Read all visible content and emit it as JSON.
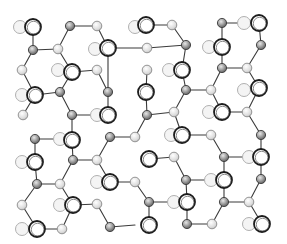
{
  "figure": {
    "title": "",
    "width": 287,
    "height": 244,
    "colors": {
      "bond": "#3a3a3a",
      "big_atom_outline": "#1c1c1c",
      "small_atom_fill": "#9a9a9a",
      "light_atom_fill": "#dcdcdc",
      "faint_atom_outline": "#b0b0b0",
      "background": "#ffffff"
    },
    "atoms": {
      "big": [
        [
          33,
          27
        ],
        [
          72,
          72
        ],
        [
          108,
          48
        ],
        [
          35,
          95
        ],
        [
          108,
          115
        ],
        [
          146,
          25
        ],
        [
          182,
          70
        ],
        [
          222,
          47
        ],
        [
          259,
          23
        ],
        [
          259,
          88
        ],
        [
          222,
          112
        ],
        [
          146,
          92
        ],
        [
          72,
          140
        ],
        [
          35,
          162
        ],
        [
          73,
          205
        ],
        [
          110,
          182
        ],
        [
          37,
          229
        ],
        [
          182,
          135
        ],
        [
          149,
          159
        ],
        [
          224,
          180
        ],
        [
          261,
          157
        ],
        [
          187,
          202
        ],
        [
          149,
          225
        ],
        [
          262,
          224
        ]
      ],
      "small": [
        [
          33,
          50
        ],
        [
          70,
          26
        ],
        [
          60,
          92
        ],
        [
          108,
          92
        ],
        [
          72,
          115
        ],
        [
          186,
          45
        ],
        [
          222,
          23
        ],
        [
          222,
          68
        ],
        [
          186,
          90
        ],
        [
          261,
          45
        ],
        [
          147,
          115
        ],
        [
          35,
          139
        ],
        [
          73,
          160
        ],
        [
          37,
          184
        ],
        [
          110,
          137
        ],
        [
          110,
          227
        ],
        [
          224,
          157
        ],
        [
          186,
          180
        ],
        [
          261,
          179
        ],
        [
          224,
          202
        ],
        [
          187,
          224
        ],
        [
          261,
          135
        ],
        [
          149,
          202
        ]
      ],
      "light": [
        [
          97,
          26
        ],
        [
          58,
          49
        ],
        [
          97,
          70
        ],
        [
          22,
          70
        ],
        [
          23,
          115
        ],
        [
          172,
          25
        ],
        [
          247,
          68
        ],
        [
          211,
          90
        ],
        [
          174,
          112
        ],
        [
          247,
          112
        ],
        [
          147,
          70
        ],
        [
          147,
          48
        ],
        [
          97,
          160
        ],
        [
          60,
          184
        ],
        [
          22,
          205
        ],
        [
          97,
          204
        ],
        [
          62,
          229
        ],
        [
          135,
          137
        ],
        [
          135,
          182
        ],
        [
          211,
          135
        ],
        [
          174,
          157
        ],
        [
          249,
          202
        ],
        [
          212,
          224
        ]
      ],
      "faint": [
        [
          20,
          27
        ],
        [
          58,
          70
        ],
        [
          95,
          49
        ],
        [
          22,
          95
        ],
        [
          97,
          115
        ],
        [
          135,
          27
        ],
        [
          209,
          47
        ],
        [
          169,
          70
        ],
        [
          244,
          23
        ],
        [
          244,
          90
        ],
        [
          209,
          112
        ],
        [
          60,
          139
        ],
        [
          22,
          162
        ],
        [
          97,
          182
        ],
        [
          60,
          205
        ],
        [
          22,
          229
        ],
        [
          171,
          135
        ],
        [
          211,
          180
        ],
        [
          249,
          157
        ],
        [
          174,
          202
        ],
        [
          249,
          224
        ]
      ]
    },
    "bonds": [
      [
        33,
        27,
        33,
        50
      ],
      [
        33,
        50,
        58,
        49
      ],
      [
        33,
        50,
        22,
        70
      ],
      [
        58,
        49,
        70,
        26
      ],
      [
        70,
        26,
        97,
        26
      ],
      [
        97,
        26,
        108,
        48
      ],
      [
        58,
        49,
        72,
        72
      ],
      [
        72,
        72,
        97,
        70
      ],
      [
        22,
        70,
        35,
        95
      ],
      [
        35,
        95,
        60,
        92
      ],
      [
        60,
        92,
        72,
        72
      ],
      [
        60,
        92,
        72,
        115
      ],
      [
        35,
        95,
        23,
        115
      ],
      [
        72,
        115,
        97,
        115
      ],
      [
        97,
        70,
        108,
        92
      ],
      [
        108,
        92,
        108,
        115
      ],
      [
        108,
        48,
        147,
        48
      ],
      [
        108,
        48,
        108,
        92
      ],
      [
        146,
        25,
        172,
        25
      ],
      [
        172,
        25,
        186,
        45
      ],
      [
        186,
        45,
        182,
        70
      ],
      [
        186,
        45,
        147,
        48
      ],
      [
        182,
        70,
        186,
        90
      ],
      [
        186,
        90,
        211,
        90
      ],
      [
        147,
        70,
        146,
        92
      ],
      [
        146,
        92,
        147,
        115
      ],
      [
        186,
        90,
        174,
        112
      ],
      [
        174,
        112,
        147,
        115
      ],
      [
        222,
        23,
        244,
        23
      ],
      [
        222,
        23,
        222,
        47
      ],
      [
        259,
        23,
        261,
        45
      ],
      [
        261,
        45,
        247,
        68
      ],
      [
        222,
        47,
        222,
        68
      ],
      [
        222,
        68,
        247,
        68
      ],
      [
        222,
        68,
        211,
        90
      ],
      [
        247,
        68,
        259,
        88
      ],
      [
        259,
        88,
        247,
        112
      ],
      [
        211,
        90,
        222,
        112
      ],
      [
        222,
        112,
        247,
        112
      ],
      [
        72,
        115,
        72,
        140
      ],
      [
        35,
        139,
        60,
        139
      ],
      [
        35,
        139,
        35,
        162
      ],
      [
        35,
        162,
        37,
        184
      ],
      [
        72,
        140,
        73,
        160
      ],
      [
        73,
        160,
        97,
        160
      ],
      [
        73,
        160,
        60,
        184
      ],
      [
        37,
        184,
        60,
        184
      ],
      [
        60,
        184,
        73,
        205
      ],
      [
        73,
        205,
        97,
        204
      ],
      [
        37,
        184,
        22,
        205
      ],
      [
        22,
        205,
        37,
        229
      ],
      [
        37,
        229,
        62,
        229
      ],
      [
        62,
        229,
        73,
        205
      ],
      [
        97,
        160,
        110,
        182
      ],
      [
        110,
        182,
        135,
        182
      ],
      [
        110,
        137,
        97,
        160
      ],
      [
        110,
        137,
        135,
        137
      ],
      [
        135,
        182,
        149,
        202
      ],
      [
        149,
        202,
        174,
        202
      ],
      [
        149,
        202,
        149,
        225
      ],
      [
        97,
        204,
        110,
        227
      ],
      [
        110,
        227,
        135,
        225
      ],
      [
        147,
        115,
        135,
        137
      ],
      [
        182,
        135,
        211,
        135
      ],
      [
        211,
        135,
        224,
        157
      ],
      [
        174,
        157,
        149,
        159
      ],
      [
        174,
        157,
        186,
        180
      ],
      [
        186,
        180,
        211,
        180
      ],
      [
        224,
        157,
        249,
        157
      ],
      [
        224,
        157,
        224,
        180
      ],
      [
        224,
        180,
        224,
        202
      ],
      [
        186,
        180,
        187,
        202
      ],
      [
        187,
        202,
        187,
        224
      ],
      [
        187,
        224,
        212,
        224
      ],
      [
        212,
        224,
        224,
        202
      ],
      [
        224,
        202,
        249,
        202
      ],
      [
        261,
        135,
        261,
        157
      ],
      [
        261,
        157,
        261,
        179
      ],
      [
        261,
        179,
        249,
        202
      ],
      [
        249,
        202,
        262,
        224
      ],
      [
        247,
        112,
        261,
        135
      ],
      [
        174,
        112,
        182,
        135
      ]
    ]
  }
}
